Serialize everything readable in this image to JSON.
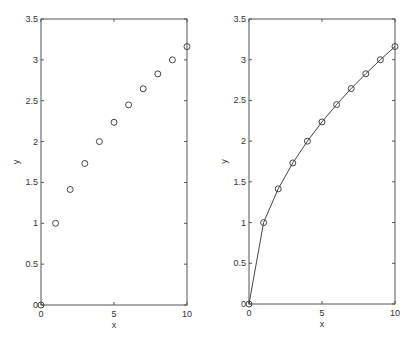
{
  "chart_data": [
    {
      "type": "scatter",
      "title": "",
      "xlabel": "x",
      "ylabel": "y",
      "xlim": [
        0,
        10
      ],
      "ylim": [
        0,
        3.5
      ],
      "xticks": [
        "0",
        "5",
        "10"
      ],
      "yticks": [
        "0",
        "0.5",
        "1",
        "1.5",
        "2",
        "2.5",
        "3",
        "3.5"
      ],
      "grid": false,
      "legend": null,
      "series": [
        {
          "name": "sqrt(x)",
          "marker": "o",
          "line": false,
          "x": [
            0,
            1,
            2,
            3,
            4,
            5,
            6,
            7,
            8,
            9,
            10
          ],
          "y": [
            0,
            1,
            1.414,
            1.732,
            2,
            2.236,
            2.449,
            2.646,
            2.828,
            3,
            3.162
          ]
        }
      ]
    },
    {
      "type": "line",
      "title": "",
      "xlabel": "x",
      "ylabel": "y",
      "xlim": [
        0,
        10
      ],
      "ylim": [
        0,
        3.5
      ],
      "xticks": [
        "0",
        "5",
        "10"
      ],
      "yticks": [
        "0",
        "0.5",
        "1",
        "1.5",
        "2",
        "2.5",
        "3",
        "3.5"
      ],
      "grid": false,
      "legend": null,
      "series": [
        {
          "name": "sqrt(x)",
          "marker": "o",
          "line": true,
          "x": [
            0,
            1,
            2,
            3,
            4,
            5,
            6,
            7,
            8,
            9,
            10
          ],
          "y": [
            0,
            1,
            1.414,
            1.732,
            2,
            2.236,
            2.449,
            2.646,
            2.828,
            3,
            3.162
          ]
        }
      ]
    }
  ],
  "colors": {
    "axis": "#555555",
    "marker": "#444444",
    "line": "#444444"
  }
}
